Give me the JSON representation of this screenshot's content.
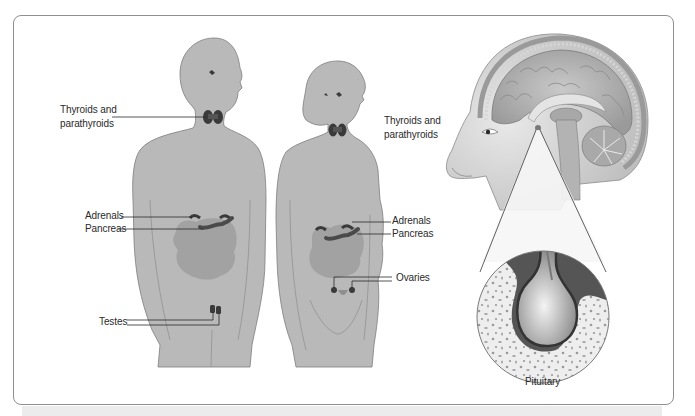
{
  "diagram": {
    "colors": {
      "body_fill": "#b9b9b9",
      "body_outline": "#7d7d7d",
      "organ_shadow": "#9d9d9d",
      "gland_dark": "#3a3a3a",
      "frame_border": "#8f8f8f",
      "label_text": "#2a2a2a",
      "leader_line": "#2a2a2a"
    },
    "figures": [
      {
        "id": "male",
        "description": "Male body silhouette"
      },
      {
        "id": "female",
        "description": "Female body silhouette"
      },
      {
        "id": "head",
        "description": "Sagittal section of head showing brain"
      },
      {
        "id": "pituitary-inset",
        "description": "Magnified circular inset of pituitary gland"
      }
    ],
    "labels": {
      "male_thyroid": "Thyroids and parathyroids",
      "male_thyroid_line1": "Thyroids and",
      "male_thyroid_line2": "parathyroids",
      "male_adrenals": "Adrenals",
      "male_pancreas": "Pancreas",
      "male_testes": "Testes",
      "female_thyroid_line1": "Thyroids and",
      "female_thyroid_line2": "parathyroids",
      "female_adrenals": "Adrenals",
      "female_pancreas": "Pancreas",
      "female_ovaries": "Ovaries",
      "pituitary": "Pituitary"
    }
  }
}
